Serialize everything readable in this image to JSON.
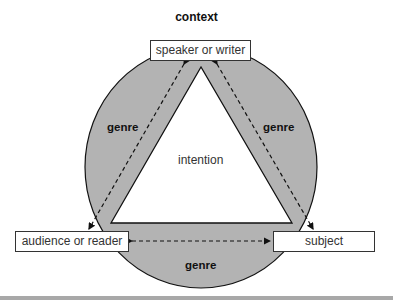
{
  "title": "context",
  "center_label": "intention",
  "nodes": {
    "top": "speaker or writer",
    "left": "audience or reader",
    "right": "subject"
  },
  "edge_labels": {
    "left": "genre",
    "right": "genre",
    "bottom": "genre"
  },
  "colors": {
    "circle_fill": "#b3b3b3",
    "stroke": "#111111",
    "bar": "#a8a8a8"
  }
}
